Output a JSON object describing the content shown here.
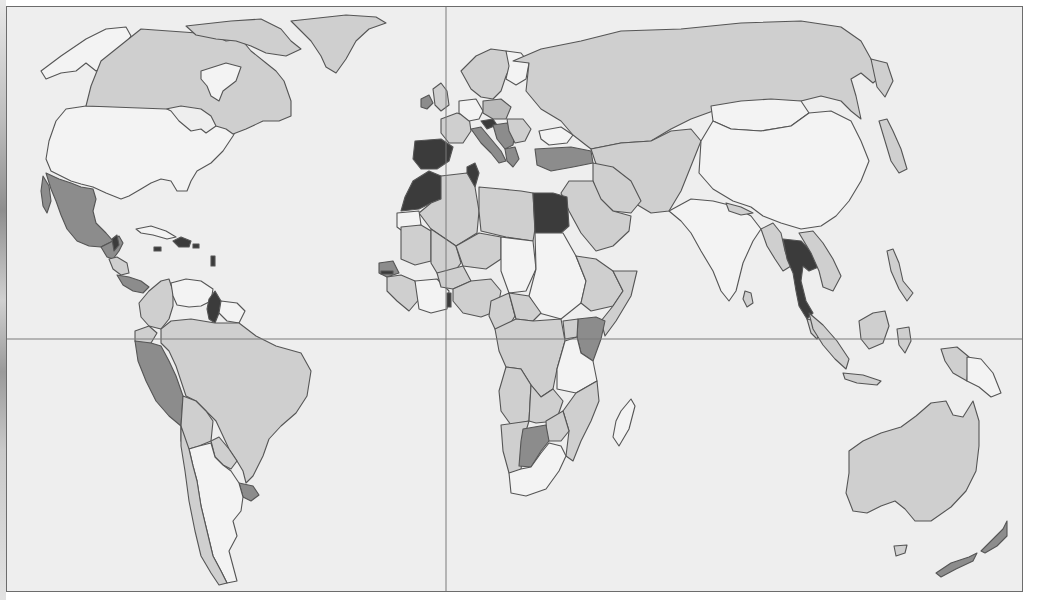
{
  "map": {
    "type": "choropleth world map",
    "projection": "simplified equirectangular-like",
    "frame": {
      "x": 6,
      "y": 6,
      "width": 1017,
      "height": 586
    },
    "gridlines": {
      "prime_meridian_x": 445,
      "equator_y": 338
    },
    "shading_classes": [
      {
        "id": "c0",
        "color": "#f3f3f3",
        "meaning": "lightest / no shading"
      },
      {
        "id": "c1",
        "color": "#cfcfcf",
        "meaning": "light gray"
      },
      {
        "id": "c2",
        "color": "#bababa",
        "meaning": "medium-light gray"
      },
      {
        "id": "c3",
        "color": "#8c8c8c",
        "meaning": "medium-dark gray"
      },
      {
        "id": "c4",
        "color": "#3b3b3b",
        "meaning": "darkest"
      }
    ],
    "regions": {
      "c0": [
        "United States",
        "Alaska",
        "Greenland interior (Hudson area)",
        "China",
        "Mongolia",
        "India",
        "Argentina",
        "Sudan",
        "Chad",
        "Niger region",
        "Tanzania",
        "South Africa",
        "Madagascar",
        "Papua New Guinea",
        "Venezuela",
        "Cuba",
        "Norway",
        "Finland",
        "Black Sea coast states"
      ],
      "c1": [
        "Canada",
        "Greenland",
        "Russia",
        "Brazil",
        "Colombia",
        "Bolivia",
        "Paraguay",
        "Chile",
        "Australia",
        "Indonesia",
        "Malaysia",
        "Myanmar",
        "Laos",
        "Vietnam",
        "Algeria",
        "Libya",
        "Mali",
        "Mauritania",
        "Nigeria",
        "Cameroon",
        "DR Congo",
        "Angola",
        "Zambia",
        "Ethiopia",
        "Somalia",
        "Saudi Arabia",
        "Iran",
        "Kazakhstan",
        "France",
        "Germany",
        "UK",
        "Sweden",
        "Japan"
      ],
      "c2": [
        "Pakistan",
        "Afghanistan",
        "Iraq",
        "Mozambique",
        "Zimbabwe",
        "Namibia",
        "Central African Republic"
      ],
      "c3": [
        "Mexico",
        "Peru",
        "Uruguay",
        "Kenya",
        "Botswana",
        "Turkey",
        "Italy",
        "Yugoslavia region",
        "Ireland",
        "Honduras",
        "Guatemala",
        "New Zealand",
        "Senegal"
      ],
      "c4": [
        "Spain",
        "Portugal",
        "Morocco",
        "Tunisia",
        "Egypt",
        "Thailand",
        "Guyana",
        "Haiti/Dominican Republic",
        "Belize",
        "Austria",
        "Gambia"
      ]
    }
  }
}
